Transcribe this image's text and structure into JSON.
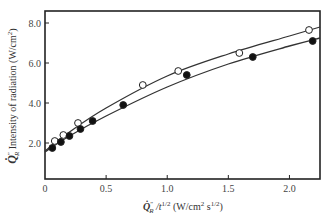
{
  "chart_data": {
    "type": "scatter",
    "title": "",
    "xlabel": "Q̇″R / t^1/2 (W/cm² s^1/2)",
    "ylabel": "Q̇″R Intensity of radiation (W/cm²)",
    "xlabel_parts": {
      "symbol": "Q̇",
      "super": "″",
      "sub": "R",
      "rest": " /t",
      "exp": "1/2",
      "units": " (W/cm",
      "units_sup": "2",
      "units2": " s",
      "units_sup2": "1/2",
      "units_end": ")"
    },
    "ylabel_parts": {
      "symbol": "Q̇",
      "super": "″",
      "sub": "R",
      "text": " Intensity of radiation (W/cm",
      "sup": "2",
      "end": ")"
    },
    "xlim": [
      0,
      2.25
    ],
    "ylim": [
      0.2,
      8.6
    ],
    "xticks": [
      "0",
      "0.5",
      "1.0",
      "1.5",
      "2.0"
    ],
    "xtick_values": [
      0,
      0.5,
      1.0,
      1.5,
      2.0
    ],
    "yticks": [
      "2.0",
      "4.0",
      "6.0",
      "8.0"
    ],
    "ytick_values": [
      2.0,
      4.0,
      6.0,
      8.0
    ],
    "grid": false,
    "legend": null,
    "series": [
      {
        "name": "open circles",
        "marker": "open-circle",
        "x": [
          0.08,
          0.15,
          0.27,
          0.8,
          1.09,
          1.59,
          2.16
        ],
        "y": [
          2.1,
          2.4,
          3.0,
          4.9,
          5.6,
          6.5,
          7.65
        ],
        "fit_curve": [
          [
            0,
            1.6
          ],
          [
            0.2,
            2.55
          ],
          [
            0.5,
            3.75
          ],
          [
            1.0,
            5.35
          ],
          [
            1.5,
            6.45
          ],
          [
            2.0,
            7.35
          ],
          [
            2.25,
            7.8
          ]
        ]
      },
      {
        "name": "filled circles",
        "marker": "filled-circle",
        "x": [
          0.06,
          0.13,
          0.2,
          0.29,
          0.39,
          0.64,
          1.16,
          1.7,
          2.19
        ],
        "y": [
          1.75,
          2.05,
          2.35,
          2.7,
          3.1,
          3.9,
          5.4,
          6.3,
          7.1
        ],
        "fit_curve": [
          [
            0,
            1.55
          ],
          [
            0.2,
            2.35
          ],
          [
            0.5,
            3.35
          ],
          [
            1.0,
            4.8
          ],
          [
            1.5,
            5.95
          ],
          [
            2.0,
            6.85
          ],
          [
            2.25,
            7.25
          ]
        ]
      }
    ]
  }
}
